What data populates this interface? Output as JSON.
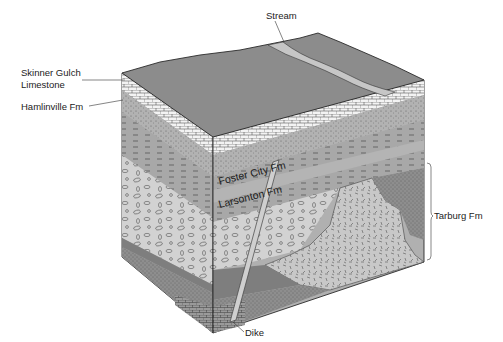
{
  "figure": {
    "type": "geologic-block-diagram",
    "labels": {
      "stream": "Stream",
      "skinner_line1": "Skinner Gulch",
      "skinner_line2": "Limestone",
      "hamlinville": "Hamlinville Fm",
      "foster_city": "Foster City Fm",
      "larsonton": "Larsonton Fm",
      "tarburg": "Tarburg Fm",
      "dike": "Dike"
    },
    "units": [
      {
        "name": "Skinner Gulch Limestone",
        "pattern": "brick"
      },
      {
        "name": "Hamlinville Fm",
        "pattern": "stippled-dashed"
      },
      {
        "name": "Foster City Fm",
        "pattern": "dashed"
      },
      {
        "name": "Larsonton Fm",
        "pattern": "dashed"
      },
      {
        "name": "Tarburg Fm",
        "pattern": "conglomerate-and-intrusive"
      },
      {
        "name": "Dike",
        "pattern": "plain"
      }
    ],
    "colors": {
      "surface": "#8c8c8c",
      "stream": "#c2c2c2",
      "limestone": "#f2f2f2",
      "shale": "#a3a3a3",
      "conglomerate": "#cfcfcf",
      "intrusive": "#c6c6c6",
      "dark_band": "#7a7a7a",
      "outline": "#2a2a2a"
    }
  }
}
